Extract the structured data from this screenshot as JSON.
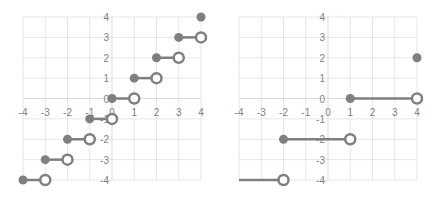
{
  "chart_data": [
    {
      "type": "scatter",
      "title": "",
      "subtitle": "Step function (floor) - closed/open endpoint segments",
      "xlabel": "",
      "ylabel": "",
      "xlim": [
        -4,
        4
      ],
      "ylim": [
        -4,
        4
      ],
      "x_ticks": [
        "-4",
        "-3",
        "-2",
        "-1",
        "0",
        "1",
        "2",
        "3",
        "4"
      ],
      "y_ticks": [
        "4",
        "3",
        "2",
        "1",
        "0",
        "-1",
        "-2",
        "-3",
        "-4"
      ],
      "grid": true,
      "legend": "none",
      "color": "#7f7f7f",
      "segments": [
        {
          "x_start": -4,
          "x_end": -3,
          "y": -4,
          "start": "closed",
          "end": "open"
        },
        {
          "x_start": -3,
          "x_end": -2,
          "y": -3,
          "start": "closed",
          "end": "open"
        },
        {
          "x_start": -2,
          "x_end": -1,
          "y": -2,
          "start": "closed",
          "end": "open"
        },
        {
          "x_start": -1,
          "x_end": 0,
          "y": -1,
          "start": "closed",
          "end": "open"
        },
        {
          "x_start": 0,
          "x_end": 1,
          "y": 0,
          "start": "closed",
          "end": "open"
        },
        {
          "x_start": 1,
          "x_end": 2,
          "y": 1,
          "start": "closed",
          "end": "open"
        },
        {
          "x_start": 2,
          "x_end": 3,
          "y": 2,
          "start": "closed",
          "end": "open"
        },
        {
          "x_start": 3,
          "x_end": 4,
          "y": 3,
          "start": "closed",
          "end": "open"
        }
      ],
      "points": [
        {
          "x": 4,
          "y": 4,
          "marker": "closed"
        }
      ]
    },
    {
      "type": "scatter",
      "title": "",
      "subtitle": "Piecewise constant function - closed/open endpoint segments",
      "xlabel": "",
      "ylabel": "",
      "xlim": [
        -4,
        4
      ],
      "ylim": [
        -4,
        4
      ],
      "x_ticks": [
        "-4",
        "-3",
        "-2",
        "-1",
        "0",
        "1",
        "2",
        "3",
        "4"
      ],
      "y_ticks": [
        "4",
        "3",
        "2",
        "1",
        "0",
        "-1",
        "-2",
        "-3",
        "-4"
      ],
      "grid": true,
      "legend": "none",
      "color": "#7f7f7f",
      "segments": [
        {
          "x_start": -4,
          "x_end": -2,
          "y": -4,
          "start": "none",
          "end": "open"
        },
        {
          "x_start": -2,
          "x_end": 1,
          "y": -2,
          "start": "closed",
          "end": "open"
        },
        {
          "x_start": 1,
          "x_end": 4,
          "y": 0,
          "start": "closed",
          "end": "open"
        }
      ],
      "points": [
        {
          "x": 4,
          "y": 2,
          "marker": "closed"
        }
      ]
    }
  ]
}
